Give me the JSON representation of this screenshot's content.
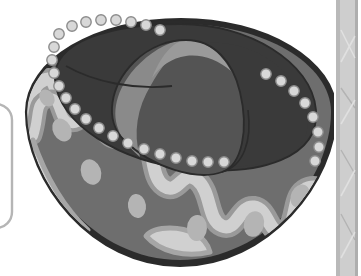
{
  "scene": {
    "title": "Sombrero hat illustration",
    "description": "Grayscale clip-art drawing of a wide-brimmed Mexican sombrero seen from a high three-quarter angle, with round pom-pom balls hanging around the brim edge and a wavy decorative band on the brim.",
    "canvas": {
      "width": 361,
      "height": 276,
      "background": "#ffffff"
    }
  },
  "palette": {
    "page_background": "#ffffff",
    "crown_dark": "#3a3a3a",
    "crown_mid": "#545454",
    "crown_light_stripe": "#8a8a8a",
    "crown_highlight": "#9a9a9a",
    "brim_base": "#6e6e6e",
    "brim_pattern_light": "#d0d0d0",
    "brim_pattern_outline": "#9a9a9a",
    "brim_dot": "#b4b4b4",
    "pompom_fill": "#d8d8d8",
    "pompom_stroke": "#8c8c8c",
    "outline": "#2b2b2b",
    "page_edge_strip": "#c9c9c9",
    "page_edge_strip_dark": "#a8a8a8",
    "frame_stroke": "#b5b5b5"
  },
  "objects": {
    "hat": {
      "label": "Sombrero",
      "parts": [
        {
          "name": "brim",
          "label": "Hat brim",
          "fill": "crown_dark"
        },
        {
          "name": "brim-face",
          "label": "Brim upper face",
          "fill": "brim_base"
        },
        {
          "name": "brim-pattern",
          "label": "Wavy decorative band",
          "fill": "brim_pattern_light"
        },
        {
          "name": "crown",
          "label": "Hat crown",
          "fill": "crown_mid"
        },
        {
          "name": "crown-shadow",
          "label": "Crown shaded side",
          "fill": "crown_dark"
        },
        {
          "name": "crown-stripe",
          "label": "Crown light stripe",
          "fill": "crown_light_stripe"
        },
        {
          "name": "pompom-trim",
          "label": "Pom-pom ball trim"
        }
      ]
    },
    "page_edge": {
      "label": "Scanned page edge strip",
      "x": 334,
      "width": 27
    },
    "frame_corner": {
      "label": "Partial rounded frame at left edge"
    }
  },
  "pompoms": {
    "label": "Pom-pom balls",
    "count": 32,
    "radius": 5.2,
    "positions": [
      [
        72,
        26
      ],
      [
        86,
        22
      ],
      [
        101,
        20
      ],
      [
        116,
        20
      ],
      [
        131,
        22
      ],
      [
        146,
        25
      ],
      [
        160,
        30
      ],
      [
        59,
        34
      ],
      [
        54,
        47
      ],
      [
        52,
        60
      ],
      [
        54,
        73
      ],
      [
        59,
        86
      ],
      [
        66,
        98
      ],
      [
        75,
        109
      ],
      [
        86,
        119
      ],
      [
        99,
        128
      ],
      [
        113,
        136
      ],
      [
        128,
        143
      ],
      [
        144,
        149
      ],
      [
        160,
        154
      ],
      [
        176,
        158
      ],
      [
        192,
        161
      ],
      [
        208,
        162
      ],
      [
        224,
        162
      ],
      [
        266,
        74
      ],
      [
        281,
        81
      ],
      [
        294,
        91
      ],
      [
        305,
        103
      ],
      [
        313,
        117
      ],
      [
        318,
        132
      ],
      [
        319,
        147
      ],
      [
        315,
        161
      ]
    ]
  },
  "brim_dots": {
    "label": "Oval accents on brim band",
    "ovals": [
      {
        "cx": 62,
        "cy": 130,
        "rx": 9,
        "ry": 12,
        "rot": -28
      },
      {
        "cx": 91,
        "cy": 172,
        "rx": 10,
        "ry": 13,
        "rot": -20
      },
      {
        "cx": 137,
        "cy": 206,
        "rx": 9,
        "ry": 12,
        "rot": -8
      },
      {
        "cx": 197,
        "cy": 228,
        "rx": 10,
        "ry": 13,
        "rot": 2
      },
      {
        "cx": 254,
        "cy": 224,
        "rx": 10,
        "ry": 13,
        "rot": 14
      },
      {
        "cx": 300,
        "cy": 196,
        "rx": 9,
        "ry": 12,
        "rot": 26
      },
      {
        "cx": 47,
        "cy": 98,
        "rx": 7,
        "ry": 9,
        "rot": -34
      }
    ]
  }
}
